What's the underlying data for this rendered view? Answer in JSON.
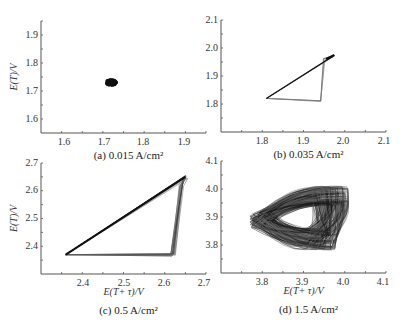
{
  "chart_data": [
    {
      "id": "a",
      "type": "scatter",
      "caption": "(a) 0.015 A/cm²",
      "xlabel": "",
      "ylabel": "E(T)/V",
      "xlim": [
        1.55,
        1.95
      ],
      "ylim": [
        1.55,
        1.95
      ],
      "xticks": [
        "1.6",
        "1.7",
        "1.8",
        "1.9"
      ],
      "yticks": [
        "1.6",
        "1.7",
        "1.8",
        "1.9"
      ],
      "description": "dense point cluster",
      "points": [
        [
          1.72,
          1.73
        ]
      ],
      "frame": {
        "x0": 41,
        "x1": 206,
        "y0": 133,
        "y1": 21
      },
      "tick_px": {
        "x": [
          64,
          104,
          143,
          184
        ],
        "y": [
          119,
          91,
          63,
          35
        ]
      }
    },
    {
      "id": "b",
      "type": "line",
      "caption": "(b) 0.035 A/cm²",
      "xlabel": "",
      "ylabel": "",
      "xlim": [
        1.7,
        2.1
      ],
      "ylim": [
        1.7,
        2.1
      ],
      "xticks": [
        "1.8",
        "1.9",
        "2.0",
        "2.1"
      ],
      "yticks": [
        "1.8",
        "1.9",
        "2.0",
        "2.1"
      ],
      "description": "triangular limit cycle",
      "points": [
        [
          1.81,
          1.82
        ],
        [
          1.94,
          1.81
        ],
        [
          1.95,
          1.96
        ],
        [
          1.97,
          1.97
        ],
        [
          1.81,
          1.82
        ]
      ],
      "frame": {
        "x0": 221,
        "x1": 386,
        "y0": 132,
        "y1": 20
      },
      "tick_px": {
        "x": [
          262,
          303,
          343,
          384
        ],
        "y": [
          104,
          76,
          48,
          20
        ]
      }
    },
    {
      "id": "c",
      "type": "line",
      "caption": "(c) 0.5 A/cm²",
      "xlabel": "E(T+ τ)/V",
      "ylabel": "E(T)/V",
      "xlim": [
        2.3,
        2.7
      ],
      "ylim": [
        2.3,
        2.7
      ],
      "xticks": [
        "2.4",
        "2.5",
        "2.6",
        "2.7"
      ],
      "yticks": [
        "2.4",
        "2.5",
        "2.6",
        "2.7"
      ],
      "description": "triangular attractor with multiple overlapping loops",
      "points": [
        [
          2.36,
          2.37
        ],
        [
          2.62,
          2.37
        ],
        [
          2.64,
          2.62
        ],
        [
          2.65,
          2.65
        ],
        [
          2.36,
          2.37
        ]
      ],
      "frame": {
        "x0": 41,
        "x1": 206,
        "y0": 274,
        "y1": 163
      },
      "tick_px": {
        "x": [
          83,
          124,
          164,
          204
        ],
        "y": [
          246,
          218,
          190,
          163
        ]
      }
    },
    {
      "id": "d",
      "type": "line",
      "caption": "(d) 1.5 A/cm²",
      "xlabel": "E(T+ τ)/V",
      "ylabel": "",
      "xlim": [
        3.7,
        4.1
      ],
      "ylim": [
        3.7,
        4.1
      ],
      "xticks": [
        "3.8",
        "3.9",
        "4.0",
        "4.1"
      ],
      "yticks": [
        "3.8",
        "3.9",
        "4.0",
        "4.1"
      ],
      "description": "chaotic attractor, dense tangle",
      "x_range": [
        3.77,
        4.02
      ],
      "y_range": [
        3.78,
        4.01
      ],
      "frame": {
        "x0": 221,
        "x1": 386,
        "y0": 273,
        "y1": 161
      },
      "tick_px": {
        "x": [
          262,
          302,
          343,
          383
        ],
        "y": [
          245,
          217,
          189,
          161
        ]
      }
    }
  ]
}
